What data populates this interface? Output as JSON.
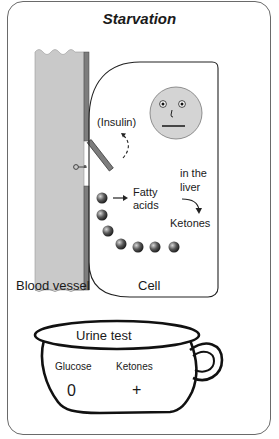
{
  "title": "Starvation",
  "labels": {
    "insulin": "(Insulin)",
    "fatty_acids_line1": "Fatty",
    "fatty_acids_line2": "acids",
    "in_the_liver_line1": "in the",
    "in_the_liver_line2": "liver",
    "ketones": "Ketones",
    "blood_vessel": "Blood vessel",
    "cell": "Cell"
  },
  "urine_test": {
    "title": "Urine test",
    "columns": [
      {
        "name": "Glucose",
        "value": "0"
      },
      {
        "name": "Ketones",
        "value": "+"
      }
    ]
  },
  "face": {
    "expression": "neutral"
  },
  "colors": {
    "vessel_fill": "#c8c8c8",
    "membrane": "#7a7a7a",
    "face_fill": "#d4d4d4",
    "outline": "#1a1a1a",
    "frame": "#6a6a6a"
  }
}
